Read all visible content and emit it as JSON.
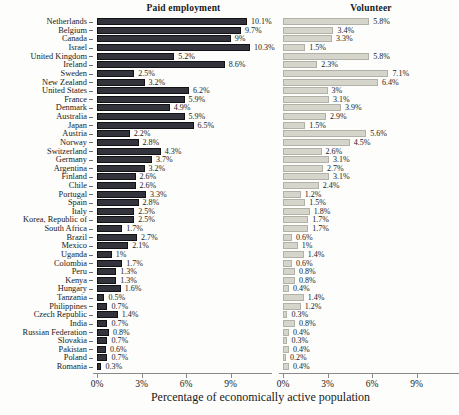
{
  "chart_data": {
    "type": "bar",
    "orientation": "horizontal",
    "xlabel": "Percentage of economically active population",
    "x_ticks": [
      "0%",
      "3%",
      "6%",
      "9%"
    ],
    "x_tick_values": [
      0,
      3,
      6,
      9
    ],
    "xlim": [
      0,
      11.8
    ],
    "grid": false,
    "legend": "none",
    "categories": [
      "Netherlands",
      "Belgium",
      "Canada",
      "Israel",
      "United Kingdom",
      "Ireland",
      "Sweden",
      "New Zealand",
      "United States",
      "France",
      "Denmark",
      "Australia",
      "Japan",
      "Austria",
      "Norway",
      "Switzerland",
      "Germany",
      "Argentina",
      "Finland",
      "Chile",
      "Portugal",
      "Spain",
      "Italy",
      "Korea, Republic of",
      "South Africa",
      "Brazil",
      "Mexico",
      "Uganda",
      "Colombia",
      "Peru",
      "Kenya",
      "Hungary",
      "Tanzania",
      "Philippines",
      "Czech Republic",
      "India",
      "Russian Federation",
      "Slovakia",
      "Pakistan",
      "Poland",
      "Romania"
    ],
    "series": [
      {
        "name": "Paid employment",
        "color": "#33333b",
        "values": [
          10.1,
          9.7,
          9,
          10.3,
          5.2,
          8.6,
          2.5,
          3.2,
          6.2,
          5.9,
          4.9,
          5.9,
          6.5,
          2.2,
          2.8,
          4.3,
          3.7,
          3.2,
          2.6,
          2.6,
          3.3,
          2.8,
          2.5,
          2.5,
          1.7,
          2.7,
          2.1,
          1,
          1.7,
          1.3,
          1.3,
          1.6,
          0.5,
          0.7,
          1.4,
          0.7,
          0.8,
          0.7,
          0.6,
          0.7,
          0.3
        ],
        "labels": [
          "10.1%",
          "9.7%",
          "9%",
          "10.3%",
          "5.2%",
          "8.6%",
          "2.5%",
          "3.2%",
          "6.2%",
          "5.9%",
          "4.9%",
          "5.9%",
          "6.5%",
          "2.2%",
          "2.8%",
          "4.3%",
          "3.7%",
          "3.2%",
          "2.6%",
          "2.6%",
          "3.3%",
          "2.8%",
          "2.5%",
          "2.5%",
          "1.7%",
          "2.7%",
          "2.1%",
          "1%",
          "1.7%",
          "1.3%",
          "1.3%",
          "1.6%",
          "0.5%",
          "0.7%",
          "1.4%",
          "0.7%",
          "0.8%",
          "0.7%",
          "0.6%",
          "0.7%",
          "0.3%"
        ]
      },
      {
        "name": "Volunteer",
        "color": "#d5d5cb",
        "values": [
          5.8,
          3.4,
          3.3,
          1.5,
          5.8,
          2.3,
          7.1,
          6.4,
          3,
          3.1,
          3.9,
          2.9,
          1.5,
          5.6,
          4.5,
          2.6,
          3.1,
          2.7,
          3.1,
          2.4,
          1.2,
          1.5,
          1.8,
          1.7,
          1.7,
          0.6,
          1,
          1.4,
          0.6,
          0.8,
          0.8,
          0.4,
          1.4,
          1.2,
          0.3,
          0.8,
          0.4,
          0.3,
          0.4,
          0.2,
          0.4
        ],
        "labels": [
          "5.8%",
          "3.4%",
          "3.3%",
          "1.5%",
          "5.8%",
          "2.3%",
          "7.1%",
          "6.4%",
          "3%",
          "3.1%",
          "3.9%",
          "2.9%",
          "1.5%",
          "5.6%",
          "4.5%",
          "2.6%",
          "3.1%",
          "2.7%",
          "3.1%",
          "2.4%",
          "1.2%",
          "1.5%",
          "1.8%",
          "1.7%",
          "1.7%",
          "0.6%",
          "1%",
          "1.4%",
          "0.6%",
          "0.8%",
          "0.8%",
          "0.4%",
          "1.4%",
          "1.2%",
          "0.3%",
          "0.8%",
          "0.4%",
          "0.3%",
          "0.4%",
          "0.2%",
          "0.4%"
        ]
      }
    ]
  }
}
